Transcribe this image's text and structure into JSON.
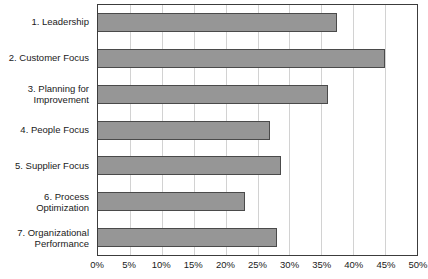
{
  "chart_data": {
    "type": "bar",
    "orientation": "horizontal",
    "title": "",
    "xlabel": "",
    "ylabel": "",
    "xlim": [
      0,
      50
    ],
    "grid": true,
    "legend": false,
    "tick_suffix": "%",
    "categories": [
      "1. Leadership",
      "2. Customer Focus",
      "3. Planning for\nImprovement",
      "4. People Focus",
      "5. Supplier Focus",
      "6. Process\nOptimization",
      "7. Organizational\nPerformance"
    ],
    "values": [
      37.4,
      45.0,
      36.1,
      27.0,
      28.7,
      23.0,
      28.0
    ],
    "tick_values": [
      0,
      5,
      10,
      15,
      20,
      25,
      30,
      35,
      40,
      45,
      50
    ],
    "tick_labels": [
      "0%",
      "5%",
      "10%",
      "15%",
      "20%",
      "25%",
      "30%",
      "35%",
      "40%",
      "45%",
      "50%"
    ],
    "colors": {
      "bar_fill": "#969696",
      "bar_border": "#4a4a4a",
      "gridline": "#d2d2d2",
      "plot_border": "#3c3c3c",
      "text": "#1a1a1a",
      "background": "#ffffff"
    }
  }
}
